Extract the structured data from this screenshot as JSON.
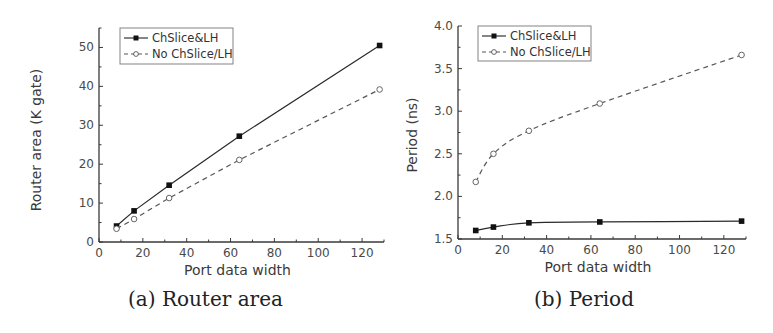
{
  "chart_data": [
    {
      "type": "line",
      "panel": "a",
      "caption": "(a) Router area",
      "title": "",
      "xlabel": "Port data width",
      "ylabel": "Router area (K gate)",
      "xlim": [
        0,
        130
      ],
      "ylim": [
        0,
        55
      ],
      "xticks": [
        0,
        20,
        40,
        60,
        80,
        100,
        120
      ],
      "yticks": [
        0,
        10,
        20,
        30,
        40,
        50
      ],
      "grid": false,
      "legend_position": "upper left",
      "x": [
        8,
        16,
        32,
        64,
        128
      ],
      "series": [
        {
          "name": "ChSlice&LH",
          "style": "solid",
          "marker": "filled-square",
          "values": [
            4.1,
            8.0,
            14.6,
            27.2,
            50.5
          ]
        },
        {
          "name": "No ChSlice/LH",
          "style": "dashed",
          "marker": "open-circle",
          "values": [
            3.4,
            5.9,
            11.3,
            21.1,
            39.2
          ]
        }
      ]
    },
    {
      "type": "line",
      "panel": "b",
      "caption": "(b) Period",
      "title": "",
      "xlabel": "Port data width",
      "ylabel": "Period (ns)",
      "xlim": [
        0,
        130
      ],
      "ylim": [
        1.5,
        4.0
      ],
      "xticks": [
        0,
        20,
        40,
        60,
        80,
        100,
        120
      ],
      "yticks": [
        1.5,
        2.0,
        2.5,
        3.0,
        3.5,
        4.0
      ],
      "grid": false,
      "legend_position": "upper left",
      "x": [
        8,
        16,
        32,
        64,
        128
      ],
      "series": [
        {
          "name": "ChSlice&LH",
          "style": "solid",
          "marker": "filled-square",
          "values": [
            1.6,
            1.64,
            1.69,
            1.7,
            1.71
          ]
        },
        {
          "name": "No ChSlice/LH",
          "style": "dashed",
          "marker": "open-circle",
          "values": [
            2.17,
            2.5,
            2.77,
            3.09,
            3.66
          ]
        }
      ]
    }
  ],
  "captions": {
    "a": "(a) Router area",
    "b": "(b) Period"
  },
  "colors": {
    "axis": "#3a3a3a",
    "series_solid": "#2a2a2a",
    "series_dashed": "#555555"
  }
}
